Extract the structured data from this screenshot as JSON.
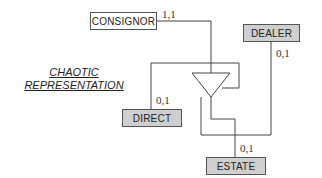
{
  "title": {
    "line1": "CHAOTIC",
    "line2": "REPRESENTATION"
  },
  "entities": [
    {
      "id": "consignor",
      "label": "CONSIGNOR",
      "fill": "#ffffff"
    },
    {
      "id": "dealer",
      "label": "DEALER",
      "fill": "#cfcfcf"
    },
    {
      "id": "direct",
      "label": "DIRECT",
      "fill": "#cfcfcf"
    },
    {
      "id": "estate",
      "label": "ESTATE",
      "fill": "#cfcfcf"
    }
  ],
  "cardinalities": {
    "consignor": "1,1",
    "dealer": "0,1",
    "direct": "0,1",
    "estate": "0,1"
  },
  "generalization_symbol": "triangle"
}
